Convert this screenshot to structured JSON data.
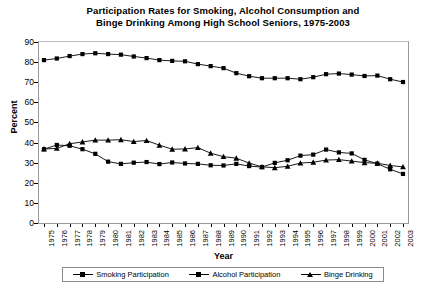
{
  "chart_data": {
    "type": "line",
    "title": "Participation Rates for Smoking, Alcohol Consumption and Binge Drinking Among High School Seniors, 1975-2003",
    "title_line1": "Participation Rates for Smoking, Alcohol Consumption and",
    "title_line2": "Binge Drinking Among High School Seniors, 1975-2003",
    "xlabel": "Year",
    "ylabel": "Percent",
    "ylim": [
      0,
      90
    ],
    "ytick_values": [
      0,
      10,
      20,
      30,
      40,
      50,
      60,
      70,
      80,
      90
    ],
    "grid": false,
    "legend_position": "bottom",
    "categories": [
      "1975",
      "1976",
      "1977",
      "1978",
      "1979",
      "1980",
      "1981",
      "1982",
      "1983",
      "1984",
      "1985",
      "1986",
      "1987",
      "1988",
      "1989",
      "1990",
      "1991",
      "1992",
      "1993",
      "1994",
      "1995",
      "1996",
      "1997",
      "1998",
      "1999",
      "2000",
      "2001",
      "2002",
      "2003"
    ],
    "series": [
      {
        "name": "Smoking Participation",
        "marker": "square",
        "values": [
          36.7,
          38.8,
          38.4,
          36.7,
          34.4,
          30.5,
          29.4,
          30.0,
          30.3,
          29.3,
          30.1,
          29.6,
          29.4,
          28.7,
          28.6,
          29.4,
          28.3,
          27.8,
          29.9,
          31.2,
          33.5,
          34.0,
          36.5,
          35.1,
          34.6,
          31.4,
          29.5,
          26.7,
          24.4
        ]
      },
      {
        "name": "Alcohol Participation",
        "marker": "square",
        "values": [
          81.0,
          81.8,
          83.0,
          84.0,
          84.4,
          84.0,
          83.7,
          82.8,
          82.0,
          81.0,
          80.6,
          80.4,
          79.0,
          78.0,
          77.0,
          74.5,
          73.0,
          72.0,
          72.0,
          72.0,
          71.5,
          72.5,
          74.0,
          74.3,
          73.8,
          73.1,
          73.3,
          71.5,
          70.1
        ]
      },
      {
        "name": "Binge Drinking",
        "marker": "triangle",
        "values": [
          36.8,
          37.1,
          39.4,
          40.3,
          41.2,
          41.2,
          41.4,
          40.5,
          41.0,
          38.7,
          36.7,
          36.8,
          37.5,
          34.7,
          33.0,
          32.2,
          29.8,
          27.9,
          27.5,
          28.2,
          29.8,
          30.2,
          31.3,
          31.5,
          30.8,
          30.0,
          29.7,
          28.6,
          27.9
        ]
      }
    ]
  },
  "legend": {
    "items": [
      {
        "label": "Smoking Participation",
        "marker": "square"
      },
      {
        "label": "Alcohol Participation",
        "marker": "square"
      },
      {
        "label": "Binge Drinking",
        "marker": "triangle"
      }
    ]
  }
}
